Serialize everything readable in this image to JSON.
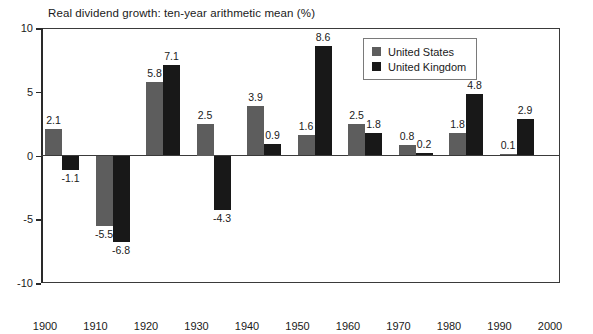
{
  "chart_data": {
    "type": "bar",
    "title": "Real dividend growth: ten-year arithmetic mean (%)",
    "xlabel": "",
    "ylabel": "",
    "ylim": [
      -10,
      10
    ],
    "yticks": [
      10,
      5,
      0,
      -5,
      -10
    ],
    "ytick_labels": [
      "10",
      "5",
      "0",
      "-5",
      "-10"
    ],
    "grid": false,
    "legend_position": "top-right",
    "categories": [
      "1900",
      "1910",
      "1920",
      "1930",
      "1940",
      "1950",
      "1960",
      "1970",
      "1980",
      "1990",
      "2000"
    ],
    "xtick_labels": [
      "1900",
      "1910",
      "1920",
      "1930",
      "1940",
      "1950",
      "1960",
      "1970",
      "1980",
      "1990",
      "2000"
    ],
    "series": [
      {
        "name": "United States",
        "color": "#5d5d5d",
        "values": [
          2.1,
          -5.5,
          5.8,
          2.5,
          3.9,
          1.6,
          2.5,
          0.8,
          1.8,
          0.1,
          null
        ],
        "labels": [
          "2.1",
          "-5.5",
          "5.8",
          "2.5",
          "3.9",
          "1.6",
          "2.5",
          "0.8",
          "1.8",
          "0.1",
          ""
        ]
      },
      {
        "name": "United Kingdom",
        "color": "#181818",
        "values": [
          -1.1,
          -6.8,
          7.1,
          -4.3,
          0.9,
          8.6,
          1.8,
          0.2,
          4.8,
          2.9,
          null
        ],
        "labels": [
          "-1.1",
          "-6.8",
          "7.1",
          "-4.3",
          "0.9",
          "8.6",
          "1.8",
          "0.2",
          "4.8",
          "2.9",
          ""
        ]
      }
    ]
  },
  "legend": {
    "items": [
      {
        "label": "United States",
        "swatch": "us"
      },
      {
        "label": "United Kingdom",
        "swatch": "uk"
      }
    ]
  }
}
